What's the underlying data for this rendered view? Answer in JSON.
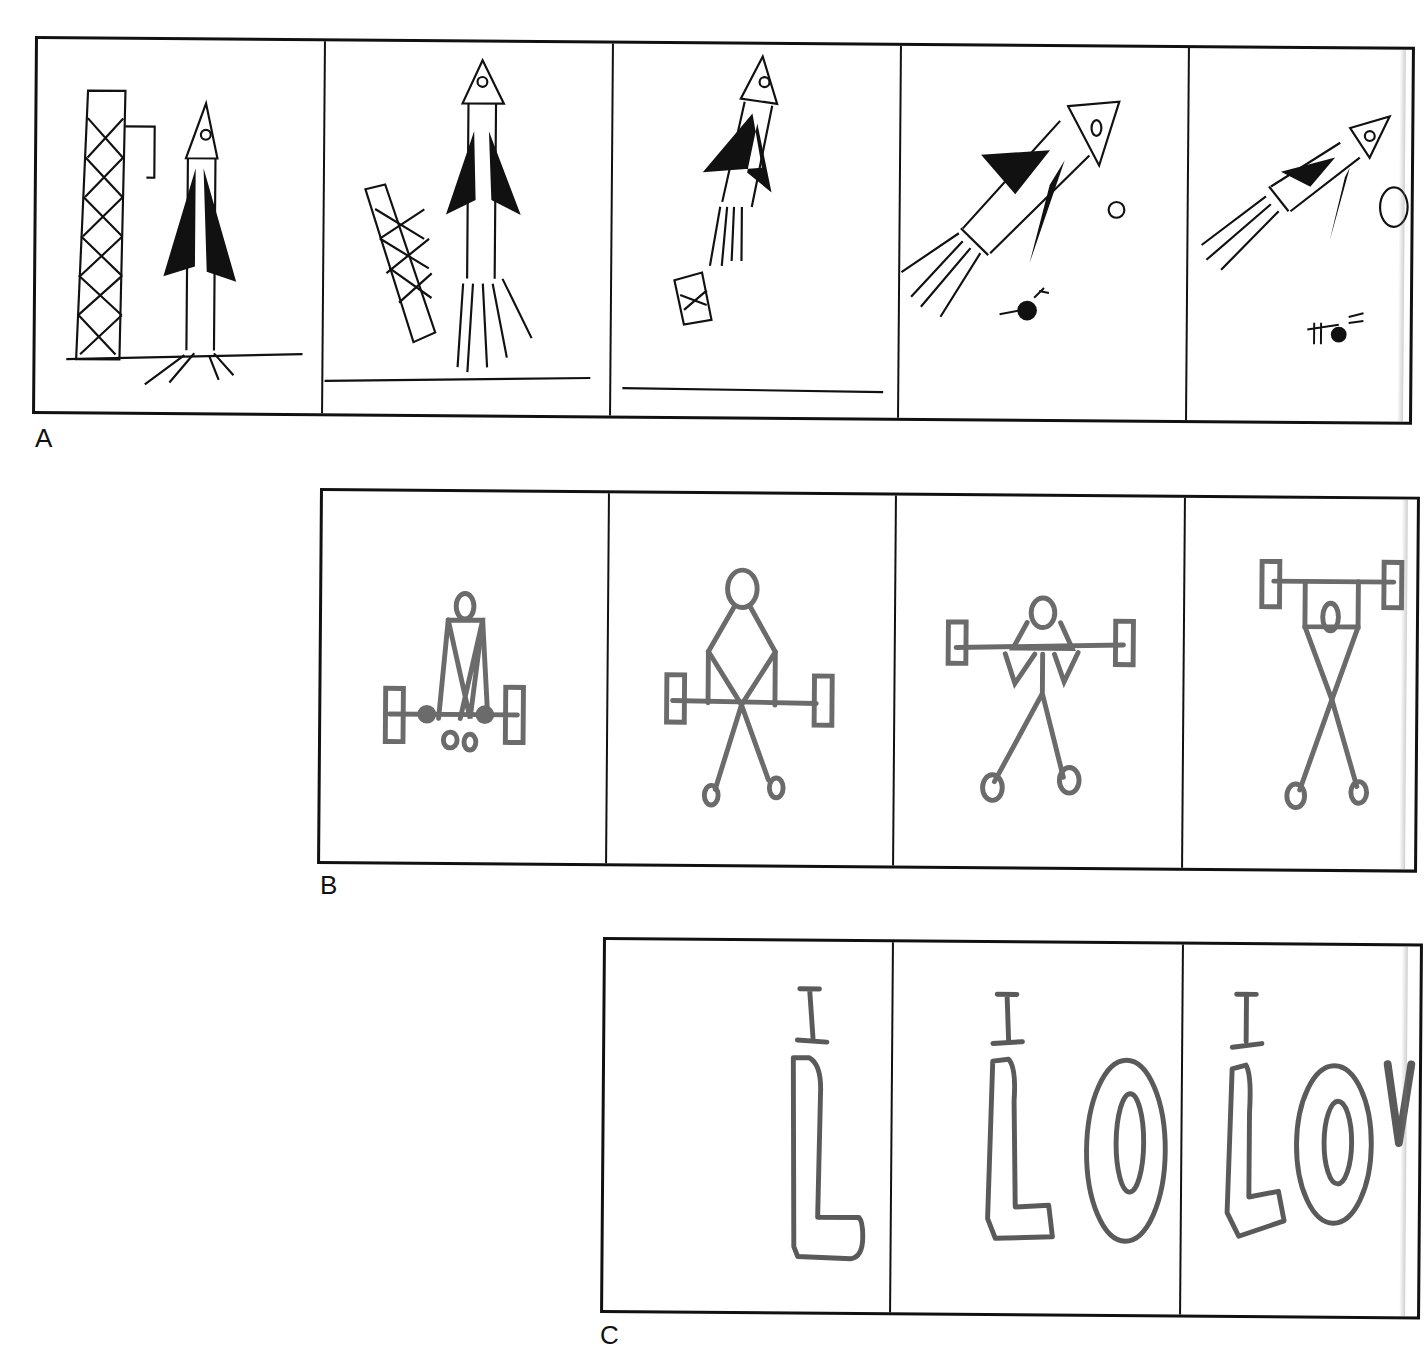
{
  "figure": {
    "rows": [
      {
        "label": "A",
        "subject": "rocket launch sequence",
        "ink_color": "#111111",
        "panels": [
          {
            "index": 1,
            "description": "rocket on launch pad next to lattice gantry tower"
          },
          {
            "index": 2,
            "description": "rocket lifting off, gantry tower falling away"
          },
          {
            "index": 3,
            "description": "rocket rising, tower debris small below"
          },
          {
            "index": 4,
            "description": "rocket flying diagonally with exhaust, small planet and astronaut-like figure"
          },
          {
            "index": 5,
            "description": "rocket continuing diagonally, planet partially cut off at edge"
          }
        ]
      },
      {
        "label": "B",
        "subject": "stick figure weightlifter sequence",
        "ink_color": "#6b6b6b",
        "panels": [
          {
            "index": 1,
            "description": "figure crouched gripping barbell at floor"
          },
          {
            "index": 2,
            "description": "figure standing with barbell at waist"
          },
          {
            "index": 3,
            "description": "figure holding barbell at shoulders"
          },
          {
            "index": 4,
            "description": "figure lifting barbell overhead"
          }
        ]
      },
      {
        "label": "C",
        "subject": "hand-lettered message sequence",
        "ink_color": "#5a5a5a",
        "panels": [
          {
            "index": 1,
            "letters": [
              "I",
              "L"
            ]
          },
          {
            "index": 2,
            "letters": [
              "I",
              "L",
              "O"
            ]
          },
          {
            "index": 3,
            "letters": [
              "I",
              "L",
              "O",
              "V"
            ]
          }
        ]
      }
    ]
  }
}
